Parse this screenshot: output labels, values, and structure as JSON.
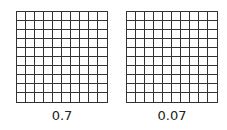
{
  "grids": [
    {
      "label": "0.7",
      "rows": 10,
      "cols": 10,
      "shaded_cells": 0
    },
    {
      "label": "0.07",
      "rows": 10,
      "cols": 10,
      "shaded_cells": 0
    }
  ],
  "colors": {
    "grid_line": "#333333",
    "background": "#ffffff"
  }
}
